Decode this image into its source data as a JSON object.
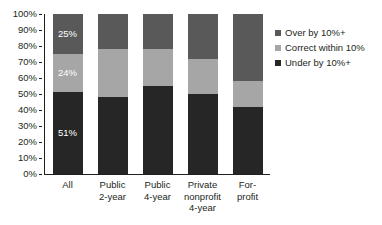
{
  "chart_data": {
    "type": "bar",
    "subtype": "stacked-100-percent",
    "title": "",
    "xlabel": "",
    "ylabel": "",
    "ylim": [
      0,
      100
    ],
    "ytick_labels": [
      "100%",
      "90%",
      "80%",
      "70%",
      "60%",
      "50%",
      "40%",
      "30%",
      "20%",
      "10%",
      "0%"
    ],
    "ytick_values": [
      100,
      90,
      80,
      70,
      60,
      50,
      40,
      30,
      20,
      10,
      0
    ],
    "grid": false,
    "legend_position": "right",
    "categories": [
      "All",
      "Public\n2-year",
      "Public\n4-year",
      "Private\nnonprofit\n4-year",
      "For-\nprofit"
    ],
    "series": [
      {
        "name": "Under by 10%+",
        "color": "#262626",
        "values": [
          51,
          48,
          55,
          50,
          42
        ],
        "labels": [
          "51%",
          "",
          "",
          "",
          ""
        ]
      },
      {
        "name": "Correct within 10%",
        "color": "#a6a6a6",
        "values": [
          24,
          30,
          23,
          22,
          16
        ],
        "labels": [
          "24%",
          "",
          "",
          "",
          ""
        ]
      },
      {
        "name": "Over by 10%+",
        "color": "#595959",
        "values": [
          25,
          22,
          22,
          28,
          42
        ],
        "labels": [
          "25%",
          "",
          "",
          "",
          ""
        ]
      }
    ],
    "legend_entries": [
      {
        "label": "Over by 10%+",
        "color": "#595959"
      },
      {
        "label": "Correct within 10%",
        "color": "#a6a6a6"
      },
      {
        "label": "Under by 10%+",
        "color": "#262626"
      }
    ],
    "axis_color": "#231f20"
  }
}
